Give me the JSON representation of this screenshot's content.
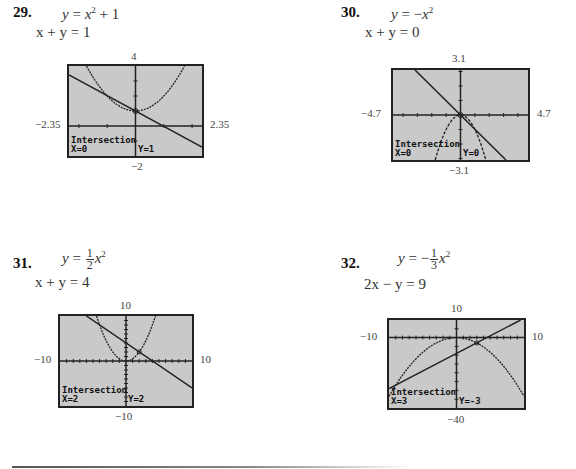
{
  "problems": [
    {
      "number": "29.",
      "eq1": {
        "lhs": "y",
        "rhs_prefix": "x",
        "sup": "2",
        "rhs_suffix": " + 1",
        "coef_num": "",
        "coef_den": "",
        "sign": ""
      },
      "eq2": "x + y = 1",
      "window": {
        "ymax": "4",
        "ymin": "−2",
        "xmin": "−2.35",
        "xmax": "2.35"
      },
      "calc": {
        "title": "Intersection",
        "x": "X=0",
        "y": "Y=1"
      }
    },
    {
      "number": "30.",
      "eq1": {
        "lhs": "y",
        "sign": "−",
        "rhs_prefix": "x",
        "sup": "2",
        "rhs_suffix": ""
      },
      "eq2": "x + y = 0",
      "window": {
        "ymax": "3.1",
        "ymin": "−3.1",
        "xmin": "−4.7",
        "xmax": "4.7"
      },
      "calc": {
        "title": "Intersection",
        "x": "X=0",
        "y": "Y=0"
      }
    },
    {
      "number": "31.",
      "eq1": {
        "lhs": "y",
        "sign": "",
        "coef_num": "1",
        "coef_den": "2",
        "rhs_prefix": "x",
        "sup": "2"
      },
      "eq2": "x + y = 4",
      "window": {
        "ymax": "10",
        "ymin": "−10",
        "xmin": "−10",
        "xmax": "10"
      },
      "calc": {
        "title": "Intersection",
        "x": "X=2",
        "y": "Y=2"
      }
    },
    {
      "number": "32.",
      "eq1": {
        "lhs": "y",
        "sign": "−",
        "coef_num": "1",
        "coef_den": "3",
        "rhs_prefix": "x",
        "sup": "2"
      },
      "eq2": "2x − y = 9",
      "window": {
        "ymax": "10",
        "ymin": "−40",
        "xmin": "−10",
        "xmax": "10"
      },
      "calc": {
        "title": "Intersection",
        "x": "X=3",
        "y": "Y=-3"
      }
    }
  ],
  "colors": {
    "screen_bg": "#c9c9c9",
    "curve": "#222222",
    "frame": "#222222"
  }
}
